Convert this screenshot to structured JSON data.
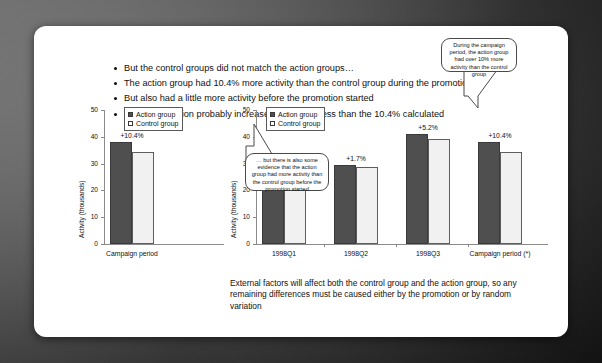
{
  "slide": {
    "bullets": [
      "But the control groups did not match the action groups…",
      "The action group had 10.4% more activity than the control group during the promotion",
      "But also had a little more activity before the promotion started",
      "So the promotion probably increased activity by less than the 10.4% calculated"
    ],
    "footnote": "External factors will affect both the control group and the action group, so any remaining differences must be caused either by the promotion or by random variation",
    "callouts": [
      {
        "id": "callout-campaign-period",
        "text": "During the campaign period, the action group had over 10% more activity than the control group"
      },
      {
        "id": "callout-before-promotion",
        "text": "… but there is also some evidence that the action group had more activity than the control group before the promotion started"
      }
    ]
  },
  "colors": {
    "action": "#4f4f4f",
    "control": "#f1f1f1",
    "axis": "#8b8b8b",
    "text": "#111111",
    "slide_background": "#ffffff"
  },
  "chart_data": [
    {
      "id": "chart-left",
      "type": "bar",
      "title": "",
      "xlabel": "",
      "ylabel": "Activity (thousands)",
      "categories": [
        "Campaign period"
      ],
      "series": [
        {
          "name": "Action group",
          "values": [
            38.0
          ]
        },
        {
          "name": "Control group",
          "values": [
            34.4
          ]
        }
      ],
      "data_labels": [
        "+10.4%"
      ],
      "ylim": [
        0,
        50
      ],
      "yticks": [
        0,
        10,
        20,
        30,
        40,
        50
      ],
      "grid": false,
      "legend": [
        "Action group",
        "Control group"
      ],
      "legend_position": "top-left"
    },
    {
      "id": "chart-right",
      "type": "bar",
      "title": "",
      "xlabel": "",
      "ylabel": "Activity (thousands)",
      "categories": [
        "1998Q1",
        "1998Q2",
        "1998Q3",
        "Campaign period (*)"
      ],
      "series": [
        {
          "name": "Action group",
          "values": [
            30.0,
            29.3,
            41.0,
            38.0
          ]
        },
        {
          "name": "Control group",
          "values": [
            28.6,
            28.8,
            39.0,
            34.4
          ]
        }
      ],
      "data_labels": [
        "+4.7%",
        "+1.7%",
        "+5.2%",
        "+10.4%"
      ],
      "ylim": [
        0,
        50
      ],
      "yticks": [
        0,
        10,
        20,
        30,
        40,
        50
      ],
      "grid": false,
      "legend": [
        "Action group",
        "Control group"
      ],
      "legend_position": "top-left"
    }
  ]
}
